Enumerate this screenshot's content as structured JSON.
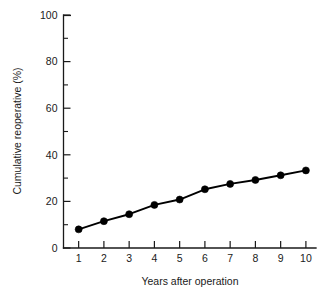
{
  "chart_data": {
    "type": "line",
    "title": "",
    "subtitle": "",
    "xlabel": "Years after operation",
    "ylabel": "Cumulative reoperative (%)",
    "x": [
      1,
      2,
      3,
      4,
      5,
      6,
      7,
      8,
      9,
      10
    ],
    "categories": [
      "1",
      "2",
      "3",
      "4",
      "5",
      "6",
      "7",
      "8",
      "9",
      "10"
    ],
    "values": [
      8.0,
      11.5,
      14.5,
      18.5,
      20.8,
      25.2,
      27.5,
      29.2,
      31.2,
      33.3
    ],
    "series": [
      {
        "name": "Cumulative reoperative rate",
        "values": [
          8.0,
          11.5,
          14.5,
          18.5,
          20.8,
          25.2,
          27.5,
          29.2,
          31.2,
          33.3
        ],
        "color": "#000000",
        "marker": "filled-circle"
      }
    ],
    "xlim": [
      0.4,
      10.4
    ],
    "ylim": [
      0,
      100
    ],
    "xticks": [
      1,
      2,
      3,
      4,
      5,
      6,
      7,
      8,
      9,
      10
    ],
    "xticklabels": [
      "1",
      "2",
      "3",
      "4",
      "5",
      "6",
      "7",
      "8",
      "9",
      "10"
    ],
    "yticks": [
      0,
      20,
      40,
      60,
      80,
      100
    ],
    "yticklabels": [
      "0",
      "20",
      "40",
      "60",
      "80",
      "100"
    ],
    "y_minor_ticks": [
      10,
      30,
      50,
      70,
      90
    ],
    "grid": false,
    "legend": false,
    "legend_position": "none",
    "annotations": [],
    "colors": {
      "background": "#ffffff",
      "axis": "#1a1a1a",
      "series": "#000000",
      "text": "#1a1a1a"
    }
  },
  "axes": {
    "y_axis_name": "cumulative-reoperative-percent-axis",
    "x_axis_name": "years-after-operation-axis"
  }
}
